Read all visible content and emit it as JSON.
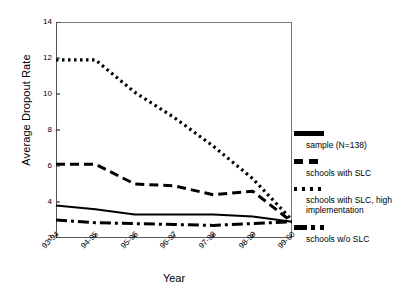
{
  "chart_data": {
    "type": "line",
    "title": "",
    "xlabel": "Year",
    "ylabel": "Average Dropout Rate",
    "categories": [
      "93-94",
      "94-95",
      "95-96",
      "96-97",
      "97-98",
      "98-99",
      "99-00"
    ],
    "ylim": [
      2,
      14
    ],
    "yticks": [
      2,
      4,
      6,
      8,
      10,
      12,
      14
    ],
    "grid": false,
    "legend_position": "right",
    "series": [
      {
        "name": "sample (N=138)",
        "style": "solid",
        "color": "#000000",
        "values": [
          3.8,
          3.6,
          3.3,
          3.3,
          3.3,
          3.2,
          2.9
        ]
      },
      {
        "name": "schools with SLC",
        "style": "dashed",
        "color": "#000000",
        "values": [
          6.1,
          6.1,
          5.0,
          4.9,
          4.4,
          4.6,
          2.9
        ]
      },
      {
        "name": "schools with SLC, high implementation",
        "style": "dotted",
        "color": "#000000",
        "values": [
          11.9,
          11.9,
          10.1,
          8.7,
          7.1,
          5.3,
          3.0
        ]
      },
      {
        "name": "schools w/o SLC",
        "style": "dash-dot",
        "color": "#000000",
        "values": [
          3.0,
          2.85,
          2.8,
          2.75,
          2.7,
          2.8,
          2.9
        ]
      }
    ]
  },
  "legend": {
    "entries": [
      {
        "label": "sample (N=138)",
        "style": "solid"
      },
      {
        "label": "schools with SLC",
        "style": "dashed"
      },
      {
        "label": "schools with SLC, high implementation",
        "style": "dotted"
      },
      {
        "label": "schools w/o SLC",
        "style": "dash-dot"
      }
    ]
  }
}
